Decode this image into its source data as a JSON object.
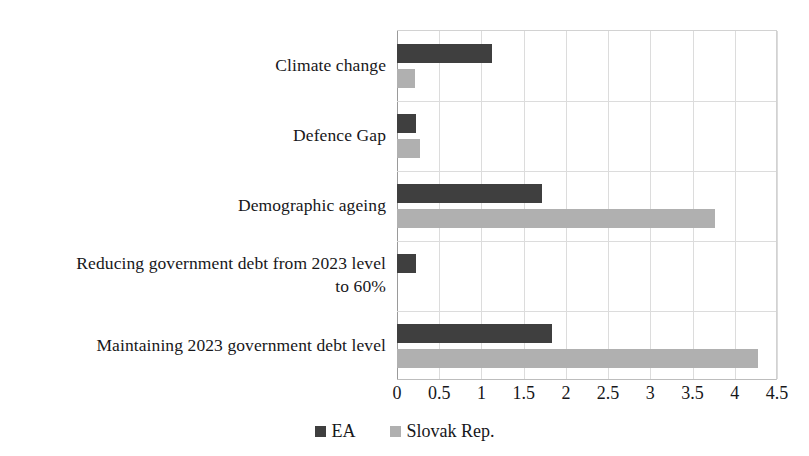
{
  "chart_data": {
    "type": "bar",
    "orientation": "horizontal",
    "title": "",
    "subtitle": "",
    "xlabel": "",
    "ylabel": "",
    "xlim": [
      0,
      4.5
    ],
    "xticks": [
      "0",
      "0.5",
      "1",
      "1.5",
      "2",
      "2.5",
      "3",
      "3.5",
      "4",
      "4.5"
    ],
    "xtick_values": [
      0,
      0.5,
      1,
      1.5,
      2,
      2.5,
      3,
      3.5,
      4,
      4.5
    ],
    "grid": "vertical-and-category-separators",
    "legend_position": "bottom-center",
    "categories": [
      "Climate change",
      "Defence Gap",
      "Demographic ageing",
      "Reducing government debt from 2023 level to 60%",
      "Maintaining 2023 government debt level"
    ],
    "category_lines": [
      [
        "Climate change"
      ],
      [
        "Defence Gap"
      ],
      [
        "Demographic ageing"
      ],
      [
        "Reducing government debt from 2023 level",
        "to 60%"
      ],
      [
        "Maintaining 2023 government debt level"
      ]
    ],
    "series": [
      {
        "name": "EA",
        "color": "#3f3f3f",
        "values": [
          1.13,
          0.23,
          1.72,
          0.22,
          1.83
        ]
      },
      {
        "name": "Slovak Rep.",
        "color": "#b0b0b0",
        "values": [
          0.21,
          0.27,
          3.77,
          0.0,
          4.28
        ]
      }
    ]
  },
  "legend": {
    "items": [
      {
        "label": "EA",
        "color": "#3f3f3f"
      },
      {
        "label": "Slovak Rep.",
        "color": "#b0b0b0"
      }
    ]
  },
  "colors": {
    "ea": "#3f3f3f",
    "slovak": "#b0b0b0",
    "grid": "#dcdcdc",
    "axis": "#9a9a9a",
    "text": "#17171a",
    "background": "#ffffff"
  }
}
